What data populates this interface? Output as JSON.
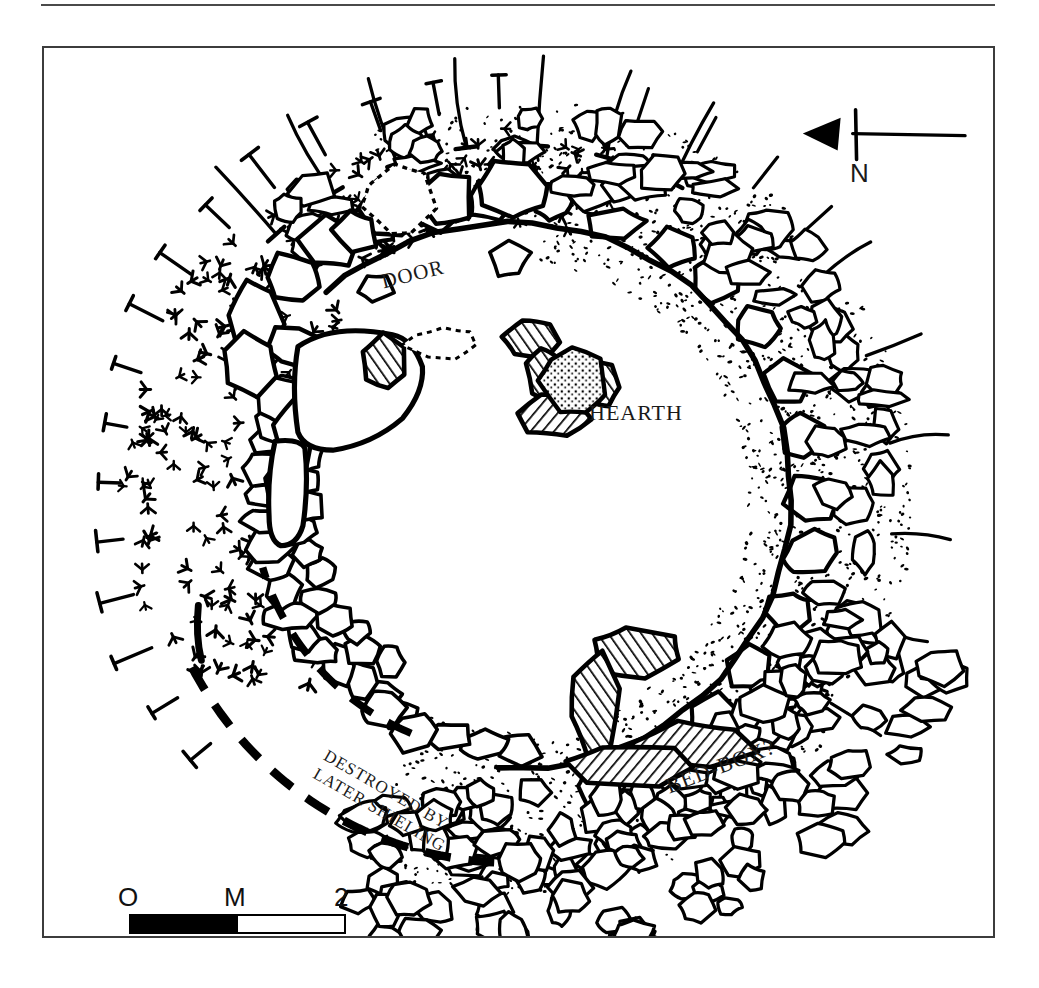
{
  "figure": {
    "kind": "archaeological-site-plan"
  },
  "labels": {
    "door": "DOOR",
    "hearth": "HEARTH",
    "bed_box": "BED-BOX?",
    "destroyed_line1": "DESTROYED BY",
    "destroyed_line2": "LATER SHIELING",
    "north": "N"
  },
  "scale": {
    "start_label": "O",
    "mid_label": "M",
    "end_label": "2",
    "unit": "M",
    "ticks": [
      "O",
      "M",
      "2"
    ]
  },
  "colors": {
    "ink": "#000000",
    "frame": "#3c3c3c",
    "rule": "#4a4a4a",
    "paper": "#ffffff"
  },
  "legend_semantics": [
    {
      "symbol": "stone-outline",
      "meaning": "drawn stone / orthostat"
    },
    {
      "symbol": "hatched-stone",
      "meaning": "slab shown in section (hatched)"
    },
    {
      "symbol": "stippled-stone",
      "meaning": "burnt / fire-reddened stone"
    },
    {
      "symbol": "stipple-fill",
      "meaning": "rubble and small stone spread"
    },
    {
      "symbol": "turf-tuft",
      "meaning": "turf / grass covered area"
    },
    {
      "symbol": "hachure-tick",
      "meaning": "edge of slope / scarp"
    },
    {
      "symbol": "dashed-arc",
      "meaning": "conjectured wall line destroyed by later shieling"
    }
  ]
}
